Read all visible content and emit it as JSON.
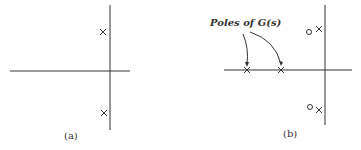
{
  "panels": [
    {
      "label": "(a)",
      "poles": [
        [
          103,
          32
        ],
        [
          104,
          113
        ]
      ],
      "zeros": []
    },
    {
      "label": "(b)",
      "annotation": "Poles of G(s)",
      "poles": [
        [
          247,
          70
        ],
        [
          281,
          70
        ],
        [
          319,
          29
        ],
        [
          319,
          110
        ]
      ],
      "zeros": [
        [
          309,
          32
        ],
        [
          310,
          107
        ]
      ]
    }
  ]
}
